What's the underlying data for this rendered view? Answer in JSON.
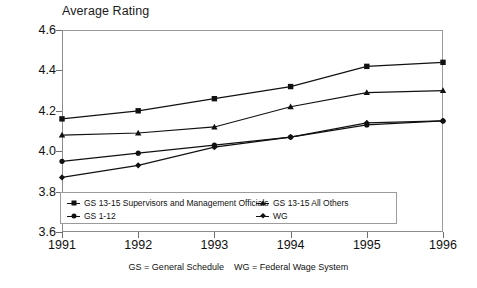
{
  "chart_data": {
    "type": "line",
    "title": "Average Rating",
    "xlabel": "",
    "ylabel": "",
    "categories": [
      "1991",
      "1992",
      "1993",
      "1994",
      "1995",
      "1996"
    ],
    "x": [
      1991,
      1992,
      1993,
      1994,
      1995,
      1996
    ],
    "ylim": [
      3.6,
      4.6
    ],
    "yticks": [
      "3.6",
      "3.8",
      "4.0",
      "4.2",
      "4.4",
      "4.6"
    ],
    "ytick_values": [
      3.6,
      3.8,
      4.0,
      4.2,
      4.4,
      4.6
    ],
    "grid": false,
    "legend_position": "inside-bottom",
    "series": [
      {
        "name": "GS 13-15 Supervisors and Management Officials",
        "marker": "square",
        "color": "#111111",
        "values": [
          4.16,
          4.2,
          4.26,
          4.32,
          4.42,
          4.44
        ]
      },
      {
        "name": "GS 13-15 All Others",
        "marker": "triangle",
        "color": "#111111",
        "values": [
          4.08,
          4.09,
          4.12,
          4.22,
          4.29,
          4.3
        ]
      },
      {
        "name": "GS 1-12",
        "marker": "circle",
        "color": "#111111",
        "values": [
          3.95,
          3.99,
          4.03,
          4.07,
          4.13,
          4.15
        ]
      },
      {
        "name": "WG",
        "marker": "diamond",
        "color": "#111111",
        "values": [
          3.87,
          3.93,
          4.02,
          4.07,
          4.14,
          4.15
        ]
      }
    ],
    "annotations": [
      "GS = General Schedule    WG = Federal Wage System"
    ]
  },
  "legend": {
    "entries": [
      {
        "label": "GS 13-15 Supervisors and Management Officials",
        "marker": "square"
      },
      {
        "label": "GS 13-15 All Others",
        "marker": "triangle"
      },
      {
        "label": "GS 1-12",
        "marker": "circle"
      },
      {
        "label": "WG",
        "marker": "diamond"
      }
    ]
  },
  "footnote": {
    "text": "GS = General Schedule    WG = Federal Wage System"
  }
}
